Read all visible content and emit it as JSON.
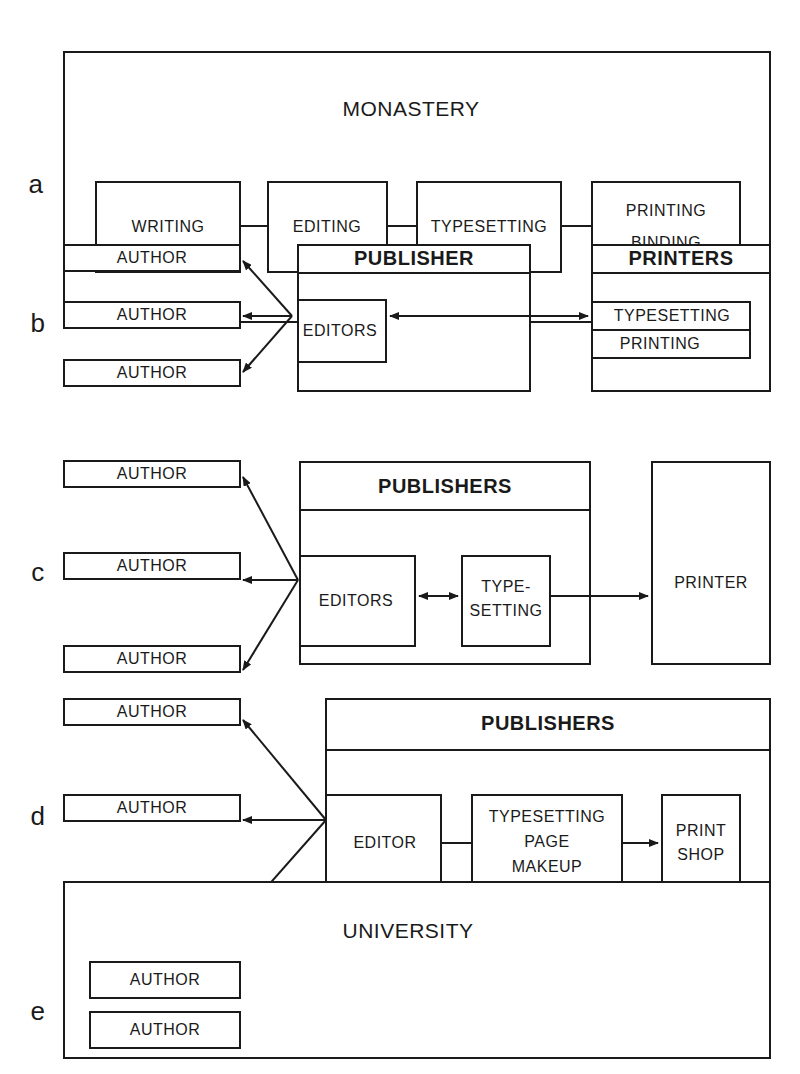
{
  "panels": {
    "a": {
      "label": "a",
      "container": "MONASTERY",
      "steps": [
        "WRITING",
        "EDITING",
        "TYPESETTING",
        "PRINTING",
        "BINDING"
      ]
    },
    "b": {
      "label": "b",
      "authors": [
        "AUTHOR",
        "AUTHOR",
        "AUTHOR"
      ],
      "publisher": "PUBLISHER",
      "editors": "EDITORS",
      "printers": "PRINTERS",
      "typesetting": "TYPESETTING",
      "printing": "PRINTING"
    },
    "c": {
      "label": "c",
      "authors": [
        "AUTHOR",
        "AUTHOR",
        "AUTHOR"
      ],
      "publishers": "PUBLISHERS",
      "editors": "EDITORS",
      "type1": "TYPE-",
      "type2": "SETTING",
      "printer": "PRINTER"
    },
    "d": {
      "label": "d",
      "authors": [
        "AUTHOR",
        "AUTHOR",
        "AUTHOR"
      ],
      "publishers": "PUBLISHERS",
      "editor": "EDITOR",
      "ts1": "TYPESETTING",
      "ts2": "PAGE",
      "ts3": "MAKEUP",
      "shop1": "PRINT",
      "shop2": "SHOP"
    },
    "e": {
      "label": "e",
      "container": "UNIVERSITY",
      "authors": [
        "AUTHOR",
        "AUTHOR",
        "AUTHOR"
      ],
      "ed1": "EDITORIAL",
      "ed2": "PROCESS",
      "computers": "COMPUTERS",
      "typesetting": "TYPESETTING",
      "shop1": "PRINT",
      "shop2": "SHOP"
    }
  },
  "colors": {
    "line": "#1a1a1a",
    "background": "#ffffff"
  }
}
